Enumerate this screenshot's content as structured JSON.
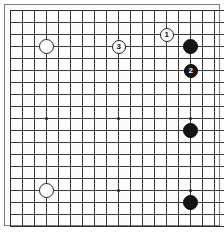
{
  "diagram": {
    "kind": "go-board-diagram",
    "game": "Go",
    "board_label": "Go board diagram",
    "visible_columns": 18,
    "visible_rows": 18,
    "background_color": "#fcfcfb",
    "line_color": "#3a3a3a",
    "black_color": "#141414",
    "white_color": "#ffffff"
  },
  "geometry": {
    "origin_x": 6,
    "origin_y": 6,
    "cell": 12,
    "cols": 18,
    "rows": 18,
    "stone_radius": 7.5,
    "marker_radius": 7.0
  },
  "star_points": [
    {
      "col": 3,
      "row": 9
    },
    {
      "col": 3,
      "row": 15
    },
    {
      "col": 9,
      "row": 9
    },
    {
      "col": 9,
      "row": 15
    },
    {
      "col": 15,
      "row": 9
    },
    {
      "col": 15,
      "row": 15
    }
  ],
  "stones": [
    {
      "id": "white-upper-left",
      "color": "white",
      "col": 3,
      "row": 3,
      "label": ""
    },
    {
      "id": "white-move-3",
      "color": "white",
      "col": 9,
      "row": 3,
      "label": "3"
    },
    {
      "id": "white-move-1",
      "color": "white",
      "col": 13,
      "row": 2,
      "label": "1"
    },
    {
      "id": "black-upper-right",
      "color": "black",
      "col": 15,
      "row": 3,
      "label": ""
    },
    {
      "id": "black-move-2",
      "color": "black",
      "col": 15,
      "row": 5,
      "label": "2"
    },
    {
      "id": "black-right-middle",
      "color": "black",
      "col": 15,
      "row": 10,
      "label": ""
    },
    {
      "id": "white-lower-left",
      "color": "white",
      "col": 3,
      "row": 15,
      "label": ""
    },
    {
      "id": "black-lower-right",
      "color": "black",
      "col": 15,
      "row": 16,
      "label": ""
    }
  ],
  "move_sequence": [
    {
      "number": "1",
      "color": "white"
    },
    {
      "number": "2",
      "color": "black"
    },
    {
      "number": "3",
      "color": "white"
    }
  ]
}
